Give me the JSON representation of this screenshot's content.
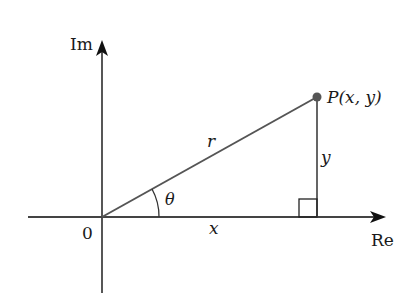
{
  "diagram": {
    "axes": {
      "imaginary_label": "Im",
      "real_label": "Re",
      "origin_label": "0"
    },
    "point": {
      "label": "P(x, y)"
    },
    "segments": {
      "hypotenuse_label": "r",
      "opposite_label": "y",
      "adjacent_label": "x",
      "angle_label": "θ"
    },
    "colors": {
      "axis": "#444444",
      "line": "#555555",
      "point": "#555555",
      "text": "#1a1a1a"
    }
  }
}
